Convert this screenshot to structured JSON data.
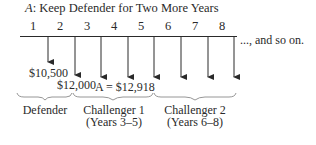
{
  "title": {
    "prefix": "A",
    "text": ": Keep Defender for Two More Years"
  },
  "timeline": {
    "periods": [
      "1",
      "2",
      "3",
      "4",
      "5",
      "6",
      "7",
      "8"
    ],
    "continuation": "..., and so on."
  },
  "cash_flows": {
    "year1": "$10,500",
    "year2": "$12,000",
    "annuity": "A = $12,918"
  },
  "groups": [
    {
      "label": "Defender",
      "sub": ""
    },
    {
      "label": "Challenger 1",
      "sub": "(Years 3–5)"
    },
    {
      "label": "Challenger 2",
      "sub": "(Years 6–8)"
    }
  ],
  "colors": {
    "line": "#2a2a2a",
    "brace": "#8a8a8a"
  }
}
